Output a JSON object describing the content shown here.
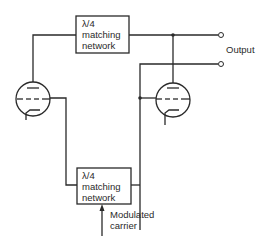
{
  "diagram": {
    "top_network": {
      "line1": "λ/4",
      "line2": "matching",
      "line3": "network"
    },
    "bottom_network": {
      "line1": "λ/4",
      "line2": "matching",
      "line3": "network"
    },
    "output_label": "Output",
    "input_label": {
      "line1": "Modulated",
      "line2": "carrier"
    },
    "colors": {
      "line": "#2a2a2a",
      "background": "#ffffff"
    }
  }
}
